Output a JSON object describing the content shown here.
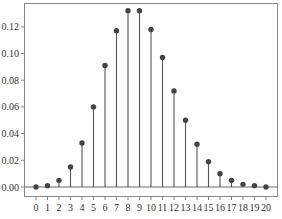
{
  "chart_data": {
    "type": "stem",
    "title": "",
    "xlabel": "",
    "ylabel": "",
    "categories": [
      0,
      1,
      2,
      3,
      4,
      5,
      6,
      7,
      8,
      9,
      10,
      11,
      12,
      13,
      14,
      15,
      16,
      17,
      18,
      19,
      20
    ],
    "values": [
      0.0,
      0.001,
      0.005,
      0.015,
      0.033,
      0.06,
      0.091,
      0.117,
      0.132,
      0.132,
      0.118,
      0.097,
      0.072,
      0.05,
      0.032,
      0.019,
      0.01,
      0.005,
      0.002,
      0.001,
      0.0
    ],
    "xlim": [
      -1,
      21
    ],
    "ylim": [
      -0.007,
      0.138
    ],
    "yticks": [
      0.0,
      0.02,
      0.04,
      0.06,
      0.08,
      0.1,
      0.12
    ],
    "ytick_labels": [
      "0.00",
      "0.02",
      "0.04",
      "0.06",
      "0.08",
      "0.10",
      "0.12"
    ],
    "xticks": [
      0,
      1,
      2,
      3,
      4,
      5,
      6,
      7,
      8,
      9,
      10,
      11,
      12,
      13,
      14,
      15,
      16,
      17,
      18,
      19,
      20
    ],
    "xtick_labels": [
      "0",
      "1",
      "2",
      "3",
      "4",
      "5",
      "6",
      "7",
      "8",
      "9",
      "10",
      "11",
      "12",
      "13",
      "14",
      "15",
      "16",
      "17",
      "18",
      "19",
      "20"
    ],
    "grid": false,
    "legend": null,
    "colors": {
      "stem": "#555555",
      "marker": "#444444",
      "baseline": "#666666",
      "frame": "#888888"
    }
  },
  "caption": "图 ... (caption text truncated at bottom edge)"
}
